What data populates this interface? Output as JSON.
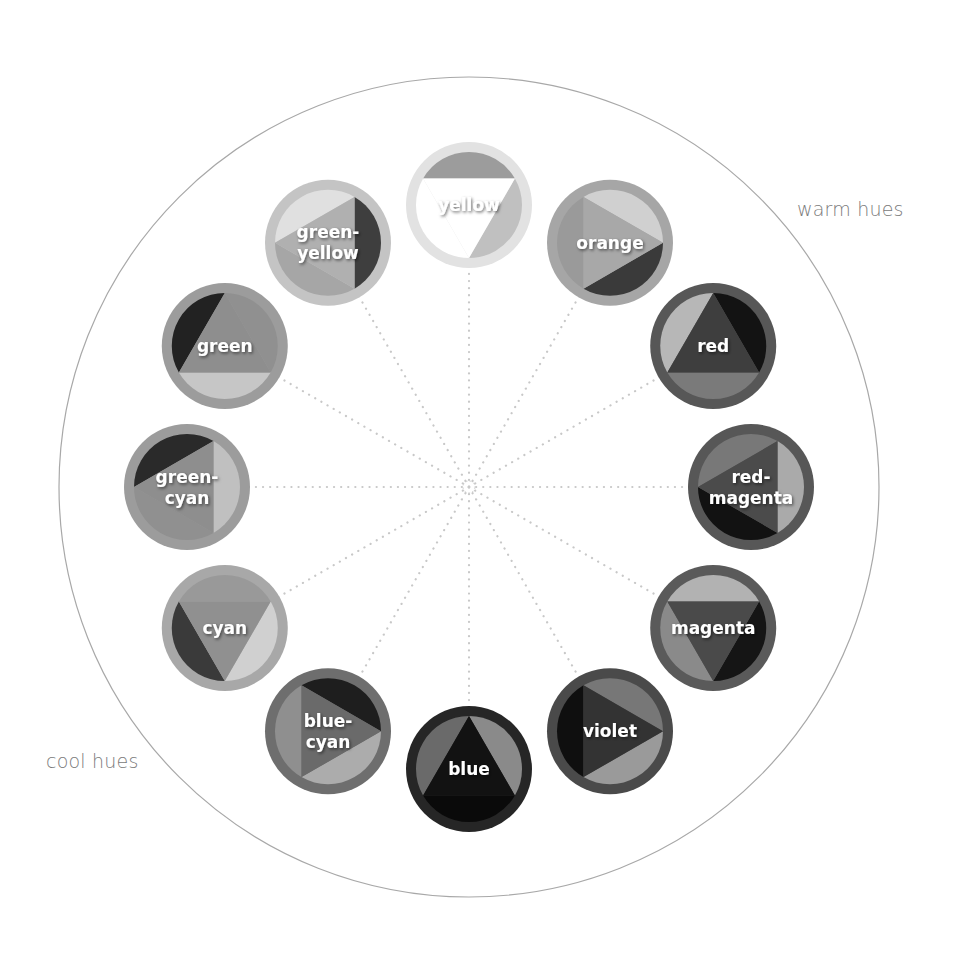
{
  "diagram": {
    "center": {
      "x": 469,
      "y": 487
    },
    "outer_circle_radius": 410,
    "ring_radius": 282,
    "hue_circle_radius": 63,
    "labels": {
      "warm": "warm hues",
      "cool": "cool hues"
    },
    "colors": {
      "outer_circle_stroke": "#a8a8a8",
      "spoke_dots": "#c8c8c8",
      "label_text": "#7a7a7a",
      "hue_text": "#ffffff"
    },
    "hues": [
      {
        "name": "yellow",
        "lines": [
          "yellow"
        ],
        "angle": -90,
        "orient": 90,
        "ring": "#e2e2e2",
        "tri": "#ffffff",
        "segs": [
          "#ffffff",
          "#9c9c9c",
          "#c0c0c0"
        ]
      },
      {
        "name": "orange",
        "lines": [
          "orange"
        ],
        "angle": -60,
        "orient": 0,
        "ring": "#a6a6a6",
        "tri": "#a8a8a8",
        "segs": [
          "#3a3a3a",
          "#9a9a9a",
          "#d0d0d0"
        ]
      },
      {
        "name": "red",
        "lines": [
          "red"
        ],
        "angle": -30,
        "orient": -90,
        "ring": "#575757",
        "tri": "#3e3e3e",
        "segs": [
          "#131313",
          "#7a7a7a",
          "#b7b7b7"
        ]
      },
      {
        "name": "red-magenta",
        "lines": [
          "red-",
          "magenta"
        ],
        "angle": 0,
        "orient": 180,
        "ring": "#575757",
        "tri": "#4b4b4b",
        "segs": [
          "#787878",
          "#aaaaaa",
          "#121212"
        ]
      },
      {
        "name": "magenta",
        "lines": [
          "magenta"
        ],
        "angle": 30,
        "orient": 90,
        "ring": "#5a5a5a",
        "tri": "#4a4a4a",
        "segs": [
          "#8a8a8a",
          "#b2b2b2",
          "#151515"
        ]
      },
      {
        "name": "violet",
        "lines": [
          "violet"
        ],
        "angle": 60,
        "orient": 0,
        "ring": "#4a4a4a",
        "tri": "#333333",
        "segs": [
          "#9a9a9a",
          "#0f0f0f",
          "#777777"
        ]
      },
      {
        "name": "blue",
        "lines": [
          "blue"
        ],
        "angle": 90,
        "orient": -90,
        "ring": "#262626",
        "tri": "#121212",
        "segs": [
          "#8a8a8a",
          "#0a0a0a",
          "#6a6a6a"
        ]
      },
      {
        "name": "blue-cyan",
        "lines": [
          "blue-",
          "cyan"
        ],
        "angle": 120,
        "orient": 0,
        "ring": "#6e6e6e",
        "tri": "#6a6a6a",
        "segs": [
          "#acacac",
          "#8f8f8f",
          "#1e1e1e"
        ]
      },
      {
        "name": "cyan",
        "lines": [
          "cyan"
        ],
        "angle": 150,
        "orient": 90,
        "ring": "#a8a8a8",
        "tri": "#909090",
        "segs": [
          "#3a3a3a",
          "#999999",
          "#d0d0d0"
        ]
      },
      {
        "name": "green-cyan",
        "lines": [
          "green-",
          "cyan"
        ],
        "angle": 180,
        "orient": 180,
        "ring": "#9c9c9c",
        "tri": "#8e8e8e",
        "segs": [
          "#2a2a2a",
          "#c0c0c0",
          "#909090"
        ]
      },
      {
        "name": "green",
        "lines": [
          "green"
        ],
        "angle": -150,
        "orient": -90,
        "ring": "#9c9c9c",
        "tri": "#8e8e8e",
        "segs": [
          "#909090",
          "#c6c6c6",
          "#222222"
        ]
      },
      {
        "name": "green-yellow",
        "lines": [
          "green-",
          "yellow"
        ],
        "angle": -120,
        "orient": 180,
        "ring": "#c4c4c4",
        "tri": "#b0b0b0",
        "segs": [
          "#e0e0e0",
          "#3e3e3e",
          "#a6a6a6"
        ]
      }
    ]
  }
}
